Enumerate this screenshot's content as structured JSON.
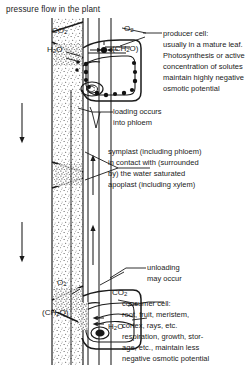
{
  "figure": {
    "title": "pressure flow in the plant",
    "domain_note": "botanical schematic of phloem pressure-flow between a producer cell and a consumer cell"
  },
  "labels": {
    "loading": [
      "loading occurs",
      "into phloem"
    ],
    "unloading": [
      "unloading",
      "may occur"
    ]
  },
  "callouts": {
    "producer": {
      "name": "producer cell:",
      "lines": [
        "usually in a mature leaf.",
        "Photosynthesis or active",
        "concentration of solutes",
        "maintain highly negative",
        "osmotic potential"
      ]
    },
    "symplast": {
      "lines": [
        "symplast (including phloem)",
        "in contact with (surrounded",
        "by) the water saturated",
        "apoplast (including xylem)"
      ]
    },
    "consumer": {
      "name": "consumer cell:",
      "lines": [
        "root, fruit, meristem,",
        "cortex, rays, etc.",
        "respiration, growth, stor-",
        "age, etc., maintain less",
        "negative osmotic potential"
      ]
    }
  },
  "chemicals": {
    "producer_co2": "CO2",
    "producer_o2": "O2",
    "producer_h2o": "H2O",
    "producer_ch2o": "(CH2O)",
    "consumer_o2": "O2",
    "consumer_co2": "CO2",
    "consumer_h2o": "H2O",
    "consumer_ch2o": "(CH2O)"
  },
  "flow": {
    "apoplast_direction": "down",
    "symplast_direction": "up"
  },
  "colors": {
    "ink": "#1a1a1a",
    "background": "#ffffff",
    "stipple": "#3a3a3a"
  }
}
